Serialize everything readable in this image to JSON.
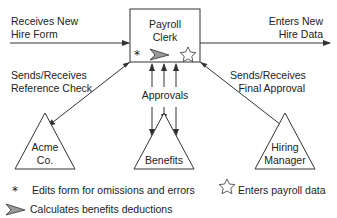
{
  "diagram": {
    "central_node": {
      "label_line1": "Payroll",
      "label_line2": "Clerk"
    },
    "inputs": {
      "receives_line1": "Receives New",
      "receives_line2": "Hire Form"
    },
    "outputs": {
      "enters_line1": "Enters New",
      "enters_line2": "Hire Data"
    },
    "edges": {
      "reference_line1": "Sends/Receives",
      "reference_line2": "Reference Check",
      "final_line1": "Sends/Receives",
      "final_line2": "Final Approval",
      "approvals": "Approvals"
    },
    "nodes": [
      {
        "line1": "Acme",
        "line2": "Co."
      },
      {
        "line1": "Benefits",
        "line2": ""
      },
      {
        "line1": "Hiring",
        "line2": "Manager"
      }
    ],
    "legend": [
      {
        "icon": "asterisk-icon",
        "text": "Edits form for omissions and errors"
      },
      {
        "icon": "star-icon",
        "text": "Enters payroll data"
      },
      {
        "icon": "arrowhead-icon",
        "text": "Calculates benefits deductions"
      }
    ],
    "colors": {
      "stroke": "#333333",
      "arrow_fill": "#999999"
    }
  }
}
